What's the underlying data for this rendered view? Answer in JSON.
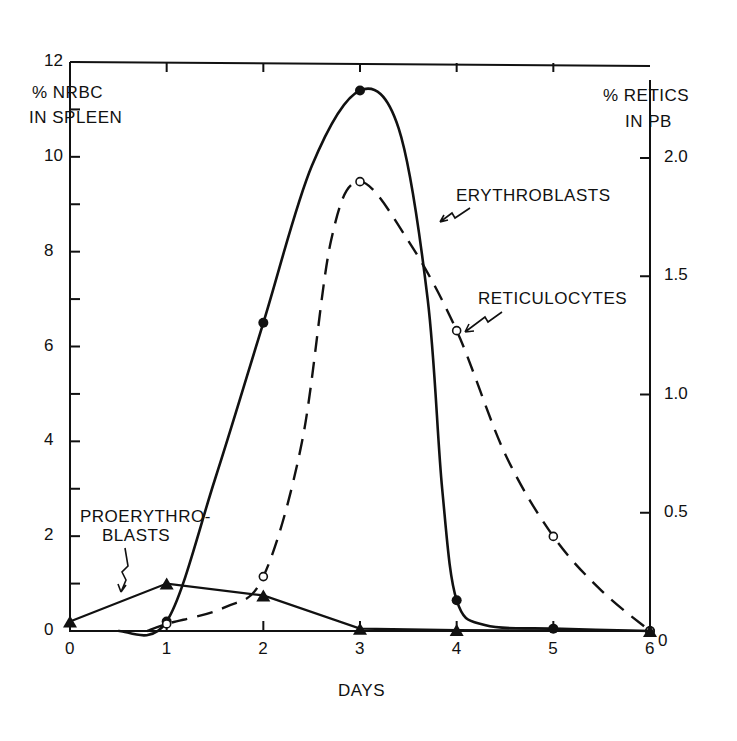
{
  "chart_data": {
    "type": "line",
    "title": "",
    "xlabel": "DAYS",
    "ylabel": "% NRBC IN SPLEEN",
    "ylabel_line1": "% NRBC",
    "ylabel_line2": "IN SPLEEN",
    "y2label": "% RETICS IN PB",
    "y2label_line1": "% RETICS",
    "y2label_line2": "IN PB",
    "x_ticks": [
      "0",
      "1",
      "2",
      "3",
      "4",
      "5",
      "6"
    ],
    "y_ticks": [
      "0",
      "2",
      "4",
      "6",
      "8",
      "10",
      "12"
    ],
    "y2_ticks": [
      "0",
      "0.5",
      "1.0",
      "1.5",
      "2.0"
    ],
    "xlim": [
      0,
      6
    ],
    "ylim": [
      0,
      12
    ],
    "y2lim": [
      0,
      2.4
    ],
    "grid": false,
    "legend": "inline annotations with arrows",
    "series": [
      {
        "name": "ERYTHROBLASTS",
        "axis": "left",
        "marker": "filled-circle",
        "line": "solid",
        "x": [
          1,
          2,
          3,
          4,
          5,
          6
        ],
        "values": [
          0.2,
          6.5,
          11.4,
          0.65,
          0.05,
          0.0
        ]
      },
      {
        "name": "RETICULOCYTES",
        "axis": "right",
        "marker": "open-circle",
        "line": "dashed",
        "x": [
          1,
          2,
          3,
          4,
          5,
          6
        ],
        "values": [
          0.03,
          0.23,
          1.9,
          1.27,
          0.4,
          0.0
        ]
      },
      {
        "name": "PROERYTHROBLASTS",
        "axis": "left",
        "marker": "filled-triangle",
        "line": "solid",
        "x": [
          0,
          1,
          2,
          3,
          4,
          6
        ],
        "values": [
          0.2,
          1.0,
          0.75,
          0.05,
          0.02,
          0.0
        ]
      }
    ],
    "annotations": [
      {
        "text": "ERYTHROBLASTS",
        "points_to": "erythroblasts curve near day 3.7"
      },
      {
        "text": "RETICULOCYTES",
        "points_to": "reticulocytes point at day 4"
      },
      {
        "text": "PROERYTHRO-",
        "text2": "BLASTS",
        "points_to": "proerythroblasts line near day 0.6"
      }
    ]
  }
}
